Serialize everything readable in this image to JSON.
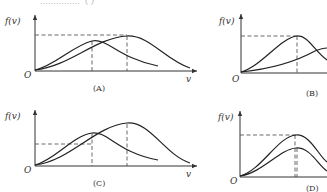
{
  "header_fragment": "……………（  ）",
  "axis": {
    "y_label": "f(v)",
    "x_label": "v",
    "origin": "O"
  },
  "panels": [
    {
      "id": "A",
      "caption": "(A)",
      "description": "Two distribution curves; taller curve peaks further right; dashed line at taller peak height and verticals at both peaks"
    },
    {
      "id": "B",
      "caption": "(B)",
      "description": "Left curve peaks higher at dashed level; second curve rises toward right, crossing"
    },
    {
      "id": "C",
      "caption": "(C)",
      "description": "Left curve lower peak, right curve higher peak; dashed horizontal at lower level; verticals at both peaks"
    },
    {
      "id": "D",
      "caption": "(D)",
      "description": "Two curves with same peak location, different heights; dashed horizontal at taller peak"
    }
  ]
}
